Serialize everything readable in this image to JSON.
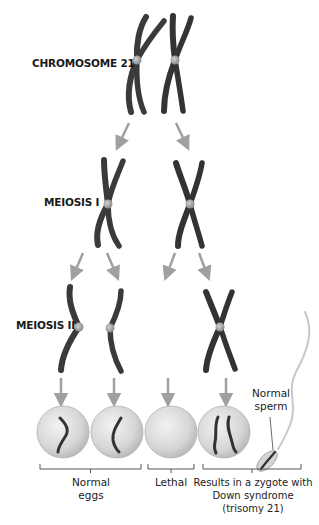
{
  "labels": {
    "chromosome": "CHROMOSOME 21",
    "meiosis1": "MEIOSIS I",
    "meiosis2": "MEIOSIS II",
    "normal_sperm_line1": "Normal",
    "normal_sperm_line2": "sperm"
  },
  "outcomes": [
    {
      "line1": "Normal",
      "line2": "eggs"
    },
    {
      "line1": "Lethal"
    },
    {
      "line1": "Results in a zygote with",
      "line2": "Down syndrome",
      "line3": "(trisomy 21)"
    }
  ],
  "colors": {
    "chromosome": "#3a3a3a",
    "centromere": "#a8a8a8",
    "arrow": "#a0a0a0",
    "cell": "#d8d8d8",
    "bracket": "#555555"
  }
}
